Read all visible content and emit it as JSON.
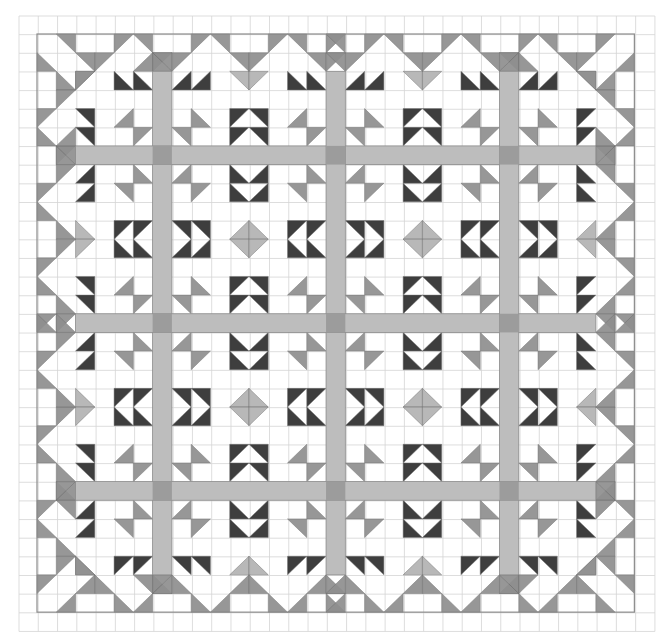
{
  "colors": {
    "paper": "#ffffff",
    "grid": "#d4d4d4",
    "outline": "#8c8c8c",
    "gray": "#8f8f8f",
    "dark": "#2e2e2e",
    "light": "#b3b3b3",
    "sash": "#bdbdbd",
    "sash_cross": "#9c9c9c"
  },
  "graph": {
    "x0": 19,
    "y0": 16,
    "cols": 33,
    "rows": 33,
    "cw": 19.27,
    "ch": 18.65
  },
  "quilt": {
    "x0": 37,
    "y0": 34,
    "size": 31,
    "cw": 19.27,
    "ch": 18.65
  },
  "sashing": {
    "positions": [
      6,
      15,
      24
    ],
    "start": 2,
    "end": 28
  },
  "block_motif": [
    [
      0,
      0,
      "BR",
      "gray"
    ],
    [
      1,
      1,
      "TL",
      "gray"
    ],
    [
      0,
      7,
      "BL",
      "gray"
    ],
    [
      1,
      6,
      "TR",
      "gray"
    ],
    [
      7,
      0,
      "TR",
      "gray"
    ],
    [
      6,
      1,
      "BL",
      "gray"
    ],
    [
      7,
      7,
      "TL",
      "gray"
    ],
    [
      6,
      6,
      "BR",
      "gray"
    ],
    [
      0,
      3,
      "BL",
      "dark"
    ],
    [
      1,
      3,
      "BL",
      "dark"
    ],
    [
      0,
      4,
      "BR",
      "dark"
    ],
    [
      1,
      4,
      "BR",
      "dark"
    ],
    [
      6,
      3,
      "TL",
      "dark"
    ],
    [
      7,
      3,
      "TL",
      "dark"
    ],
    [
      6,
      4,
      "TR",
      "dark"
    ],
    [
      7,
      4,
      "TR",
      "dark"
    ],
    [
      3,
      0,
      "TR",
      "dark"
    ],
    [
      3,
      1,
      "TR",
      "dark"
    ],
    [
      4,
      0,
      "BR",
      "dark"
    ],
    [
      4,
      1,
      "BR",
      "dark"
    ],
    [
      3,
      6,
      "TL",
      "dark"
    ],
    [
      3,
      7,
      "TL",
      "dark"
    ],
    [
      4,
      6,
      "BL",
      "dark"
    ],
    [
      4,
      7,
      "BL",
      "dark"
    ],
    [
      3,
      3,
      "BR",
      "light"
    ],
    [
      3,
      4,
      "BL",
      "light"
    ],
    [
      4,
      3,
      "TR",
      "light"
    ],
    [
      4,
      4,
      "TL",
      "light"
    ]
  ],
  "block_origins": [
    -2,
    7,
    16,
    25
  ],
  "border_quadrant": [
    [
      0,
      1,
      "TR",
      "gray"
    ],
    [
      0,
      4,
      "TL",
      "gray"
    ],
    [
      0,
      5,
      "TR",
      "gray"
    ],
    [
      0,
      8,
      "TL",
      "gray"
    ],
    [
      0,
      9,
      "TR",
      "gray"
    ],
    [
      0,
      12,
      "TL",
      "gray"
    ],
    [
      0,
      13,
      "TR",
      "gray"
    ],
    [
      1,
      0,
      "BL",
      "gray"
    ],
    [
      1,
      2,
      "TR",
      "gray"
    ],
    [
      1,
      3,
      "TL",
      "gray"
    ],
    [
      1,
      6,
      "TL",
      "gray"
    ],
    [
      1,
      6,
      "TR",
      "gray"
    ],
    [
      1,
      7,
      "TL",
      "gray"
    ],
    [
      1,
      10,
      "TR",
      "gray"
    ],
    [
      1,
      11,
      "TL",
      "gray"
    ],
    [
      1,
      14,
      "TR",
      "gray"
    ],
    [
      1,
      15,
      "TL",
      "gray"
    ],
    [
      1,
      15,
      "TR",
      "gray"
    ],
    [
      2,
      1,
      "BL",
      "gray"
    ],
    [
      2,
      2,
      "TL",
      "gray"
    ],
    [
      4,
      0,
      "TL",
      "gray"
    ],
    [
      5,
      0,
      "BL",
      "gray"
    ],
    [
      3,
      1,
      "TL",
      "gray"
    ],
    [
      6,
      1,
      "BL",
      "gray"
    ],
    [
      5,
      1,
      "BR",
      "gray"
    ],
    [
      6,
      1,
      "TR",
      "gray"
    ],
    [
      8,
      0,
      "TL",
      "gray"
    ],
    [
      9,
      0,
      "BL",
      "gray"
    ],
    [
      7,
      1,
      "TL",
      "gray"
    ],
    [
      10,
      1,
      "BL",
      "gray"
    ],
    [
      12,
      0,
      "TL",
      "gray"
    ],
    [
      13,
      0,
      "BL",
      "gray"
    ],
    [
      11,
      1,
      "TL",
      "gray"
    ],
    [
      14,
      1,
      "BL",
      "gray"
    ],
    [
      15,
      0,
      "TL",
      "gray"
    ],
    [
      15,
      0,
      "BL",
      "gray"
    ],
    [
      15,
      1,
      "TL",
      "gray"
    ],
    [
      15,
      1,
      "BL",
      "gray"
    ]
  ]
}
